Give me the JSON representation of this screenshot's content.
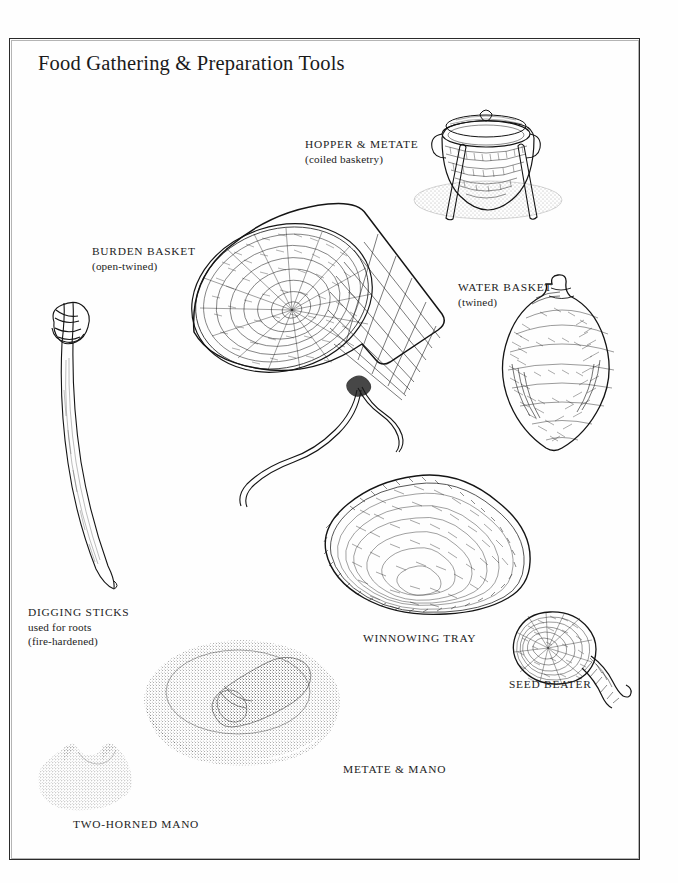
{
  "page": {
    "title": "Food Gathering & Preparation Tools",
    "background_color": "#fefefe",
    "ink_color": "#141414",
    "border_color": "#2a2a2a"
  },
  "figures": [
    {
      "id": "hopper-metate",
      "name": "hopper-and-metate",
      "caption": "HOPPER & METATE",
      "subcaption": "(coiled basketry)",
      "label_x": 305,
      "label_y": 138
    },
    {
      "id": "burden-basket",
      "name": "burden-basket",
      "caption": "BURDEN BASKET",
      "subcaption": "(open-twined)",
      "label_x": 92,
      "label_y": 245
    },
    {
      "id": "water-basket",
      "name": "water-basket",
      "caption": "WATER BASKET",
      "subcaption": "(twined)",
      "label_x": 458,
      "label_y": 281
    },
    {
      "id": "digging-sticks",
      "name": "digging-sticks",
      "caption": "DIGGING STICKS",
      "subcaption": "used for roots",
      "subcaption2": "(fire-hardened)",
      "label_x": 28,
      "label_y": 606
    },
    {
      "id": "winnowing-tray",
      "name": "winnowing-tray",
      "caption": "WINNOWING TRAY",
      "subcaption": "",
      "label_x": 363,
      "label_y": 632
    },
    {
      "id": "seed-beater",
      "name": "seed-beater",
      "caption": "SEED BEATER",
      "subcaption": "",
      "label_x": 509,
      "label_y": 678
    },
    {
      "id": "metate-mano",
      "name": "metate-and-mano",
      "caption": "METATE & MANO",
      "subcaption": "",
      "label_x": 343,
      "label_y": 763
    },
    {
      "id": "two-horned-mano",
      "name": "two-horned-mano",
      "caption": "TWO-HORNED MANO",
      "subcaption": "",
      "label_x": 73,
      "label_y": 818
    }
  ]
}
